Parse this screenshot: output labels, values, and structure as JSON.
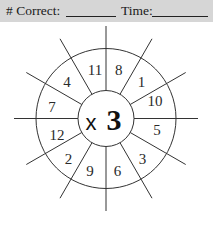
{
  "header": {
    "correct_label": "# Correct:",
    "time_label": "Time:",
    "background": "#d6d6d6"
  },
  "wheel": {
    "operator": "x",
    "multiplier": "3",
    "numbers_clockwise_from_top": [
      "8",
      "1",
      "10",
      "5",
      "3",
      "6",
      "9",
      "2",
      "12",
      "7",
      "4",
      "11"
    ]
  }
}
